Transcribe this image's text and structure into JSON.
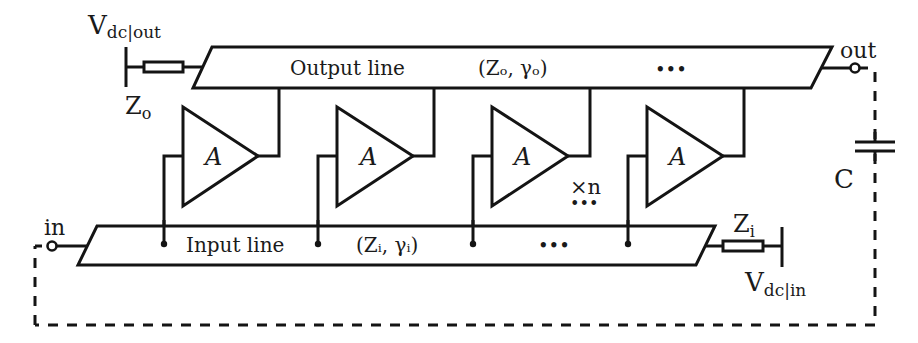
{
  "diagram": {
    "output_line": {
      "label": "Output line",
      "params": "(Zₒ, γₒ)",
      "ellipsis": "•••"
    },
    "input_line": {
      "label": "Input line",
      "params": "(Zᵢ, γᵢ)",
      "ellipsis": "•••"
    },
    "labels": {
      "vdc_out_main": "V",
      "vdc_out_sub": "dc|out",
      "vdc_in_main": "V",
      "vdc_in_sub": "dc|in",
      "z_out_main": "Z",
      "z_out_sub": "o",
      "z_in_main": "Z",
      "z_in_sub": "i",
      "out_port": "out",
      "in_port": "in",
      "capacitor": "C",
      "repeat": "×n",
      "repeat_dots": "•••"
    },
    "amplifiers": [
      {
        "label": "A"
      },
      {
        "label": "A"
      },
      {
        "label": "A"
      },
      {
        "label": "A"
      }
    ],
    "colors": {
      "line": "#141414",
      "background": "#ffffff"
    }
  }
}
